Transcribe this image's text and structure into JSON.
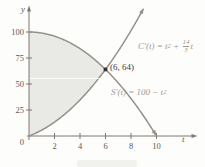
{
  "figure": {
    "kind": "textbook calculus figure: cost and savings rate curves with shaded area between them"
  },
  "colors": {
    "background": "#fdfdfb",
    "curve": "#96908a",
    "shade": "#e9e9e5",
    "axis": "#7e7973",
    "tick_text": "#5c5854",
    "eq_text": "#a19a91",
    "point": "#33302d",
    "point_text": "#44413e"
  },
  "axis_labels": {
    "y": "y",
    "t": "t",
    "origin": "0"
  },
  "equations": {
    "c_prefix": "C′(t) = t",
    "c_sup": "2",
    "c_mid": " + ",
    "c_frac_num": "14",
    "c_frac_den": "3",
    "c_suffix": "t",
    "s_prefix": "S′(t) = 100 − t",
    "s_sup": "2",
    "point_label": "(6, 64)"
  },
  "chart_data": {
    "type": "line",
    "title": "",
    "xlabel": "t",
    "ylabel": "y",
    "xlim": [
      0,
      13.2
    ],
    "ylim": [
      0,
      126
    ],
    "x_ticks": [
      2,
      4,
      6,
      8,
      10
    ],
    "y_ticks": [
      25,
      50,
      75,
      100
    ],
    "grid": false,
    "legend": "inline curve labels",
    "series": [
      {
        "name": "C'(t) = t² + (14/3)t",
        "poly": [
          0,
          4.666667,
          1
        ],
        "t_range": [
          0,
          9.0
        ],
        "arrow_end": true
      },
      {
        "name": "S'(t) = 100 − t²",
        "poly": [
          100,
          0,
          -1
        ],
        "t_range": [
          0,
          10
        ],
        "arrow_end": true
      }
    ],
    "intersection_point": {
      "t": 6,
      "y": 64,
      "label": "(6, 64)"
    },
    "shaded_region": {
      "between": [
        "S'(t)",
        "C'(t)"
      ],
      "t_from": 0,
      "t_to": 6
    },
    "key_points": [
      {
        "t": 0,
        "y": 100,
        "on": "S'"
      },
      {
        "t": 10,
        "y": 0,
        "on": "S'"
      },
      {
        "t": 0,
        "y": 0,
        "on": "C'"
      },
      {
        "t": 6,
        "y": 64,
        "on": "both"
      }
    ]
  }
}
